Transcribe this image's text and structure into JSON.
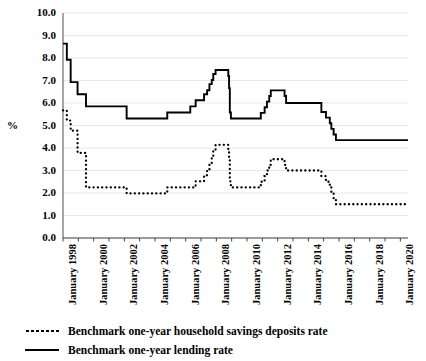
{
  "axis": {
    "y_title": "%",
    "y_ticks": [
      "10.0",
      "9.0",
      "8.0",
      "7.0",
      "6.0",
      "5.0",
      "4.0",
      "3.0",
      "2.0",
      "1.0",
      "0.0"
    ],
    "x_ticks": [
      "January 1998",
      "January 2000",
      "January 2002",
      "January 2004",
      "January 2006",
      "January 2008",
      "January 2010",
      "January 2012",
      "January 2014",
      "January 2016",
      "January 2018",
      "January 2020"
    ]
  },
  "legend": {
    "items": [
      {
        "label": "Benchmark one-year household savings deposits rate",
        "style": "dotted"
      },
      {
        "label": "Benchmark one-year lending rate",
        "style": "solid"
      }
    ]
  },
  "colors": {
    "line": "#000000",
    "grid": "#e8e8e8",
    "axis": "#808080",
    "background": "#ffffff"
  },
  "chart_data": {
    "type": "line",
    "title": "",
    "xlabel": "",
    "ylabel": "%",
    "ylim": [
      0,
      10
    ],
    "xlim": [
      1998,
      2020.5
    ],
    "grid": true,
    "legend_position": "bottom-left",
    "step": "post",
    "x_tick_values": [
      1998,
      2000,
      2002,
      2004,
      2006,
      2008,
      2010,
      2012,
      2014,
      2016,
      2018,
      2020
    ],
    "series": [
      {
        "name": "Benchmark one-year lending rate",
        "style": "solid",
        "points": [
          [
            1998.0,
            8.64
          ],
          [
            1998.25,
            7.92
          ],
          [
            1998.5,
            6.93
          ],
          [
            1998.95,
            6.39
          ],
          [
            1999.5,
            5.85
          ],
          [
            2002.15,
            5.31
          ],
          [
            2004.8,
            5.58
          ],
          [
            2006.3,
            5.85
          ],
          [
            2006.65,
            6.12
          ],
          [
            2007.2,
            6.39
          ],
          [
            2007.4,
            6.57
          ],
          [
            2007.55,
            6.84
          ],
          [
            2007.7,
            7.02
          ],
          [
            2007.8,
            7.29
          ],
          [
            2007.95,
            7.47
          ],
          [
            2008.7,
            7.47
          ],
          [
            2008.78,
            7.2
          ],
          [
            2008.83,
            6.66
          ],
          [
            2008.88,
            5.58
          ],
          [
            2008.95,
            5.31
          ],
          [
            2010.8,
            5.31
          ],
          [
            2010.9,
            5.56
          ],
          [
            2011.15,
            5.81
          ],
          [
            2011.3,
            6.06
          ],
          [
            2011.45,
            6.31
          ],
          [
            2011.55,
            6.56
          ],
          [
            2012.45,
            6.31
          ],
          [
            2012.55,
            6.0
          ],
          [
            2014.85,
            5.6
          ],
          [
            2015.15,
            5.35
          ],
          [
            2015.4,
            5.1
          ],
          [
            2015.5,
            4.85
          ],
          [
            2015.65,
            4.6
          ],
          [
            2015.8,
            4.35
          ],
          [
            2020.5,
            4.35
          ]
        ]
      },
      {
        "name": "Benchmark one-year household savings deposits rate",
        "style": "dotted",
        "points": [
          [
            1998.0,
            5.67
          ],
          [
            1998.25,
            5.22
          ],
          [
            1998.5,
            4.77
          ],
          [
            1998.95,
            3.78
          ],
          [
            1999.5,
            2.25
          ],
          [
            2002.15,
            1.98
          ],
          [
            2004.8,
            2.25
          ],
          [
            2006.65,
            2.52
          ],
          [
            2007.2,
            2.79
          ],
          [
            2007.4,
            3.06
          ],
          [
            2007.55,
            3.33
          ],
          [
            2007.7,
            3.6
          ],
          [
            2007.8,
            3.87
          ],
          [
            2007.95,
            4.14
          ],
          [
            2008.7,
            4.14
          ],
          [
            2008.78,
            3.87
          ],
          [
            2008.83,
            3.6
          ],
          [
            2008.88,
            2.52
          ],
          [
            2008.95,
            2.25
          ],
          [
            2010.8,
            2.25
          ],
          [
            2010.9,
            2.5
          ],
          [
            2011.15,
            2.75
          ],
          [
            2011.3,
            3.0
          ],
          [
            2011.45,
            3.25
          ],
          [
            2011.55,
            3.5
          ],
          [
            2012.45,
            3.25
          ],
          [
            2012.55,
            3.0
          ],
          [
            2014.85,
            2.75
          ],
          [
            2015.15,
            2.5
          ],
          [
            2015.4,
            2.25
          ],
          [
            2015.5,
            2.0
          ],
          [
            2015.65,
            1.75
          ],
          [
            2015.8,
            1.5
          ],
          [
            2020.5,
            1.5
          ]
        ]
      }
    ]
  }
}
